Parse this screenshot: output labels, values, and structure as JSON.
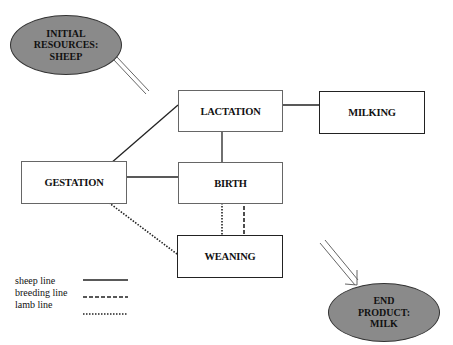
{
  "diagram": {
    "start_node": {
      "line1": "INITIAL",
      "line2": "RESOURCES:",
      "line3": "SHEEP"
    },
    "end_node": {
      "line1": "END",
      "line2": "PRODUCT:",
      "line3": "MILK"
    },
    "nodes": {
      "lactation": "LACTATION",
      "milking": "MILKING",
      "gestation": "GESTATION",
      "birth": "BIRTH",
      "weaning": "WEANING"
    },
    "edges": [
      {
        "from": "gestation",
        "to": "lactation",
        "type": "sheep line"
      },
      {
        "from": "lactation",
        "to": "milking",
        "type": "sheep line"
      },
      {
        "from": "lactation",
        "to": "birth",
        "type": "sheep line"
      },
      {
        "from": "gestation",
        "to": "birth",
        "type": "sheep line"
      },
      {
        "from": "birth",
        "to": "weaning",
        "type": "lamb line"
      },
      {
        "from": "birth",
        "to": "weaning",
        "type": "breeding line"
      },
      {
        "from": "gestation",
        "to": "weaning",
        "type": "lamb line"
      }
    ],
    "legend": [
      {
        "label": "sheep line",
        "style": "solid"
      },
      {
        "label": "breeding line",
        "style": "dashed"
      },
      {
        "label": "lamb line",
        "style": "dotted"
      }
    ],
    "colors": {
      "ellipse_fill": "#8a8a8a",
      "line": "#222222"
    }
  }
}
